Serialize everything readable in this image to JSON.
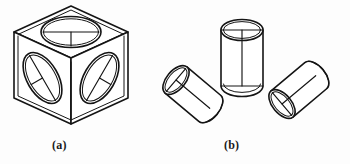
{
  "figure": {
    "background_color": "#fdfdfd",
    "ink_color": "#141414",
    "captions": [
      {
        "key": "a",
        "label": "(a)",
        "subject": "cube-with-isometric-circles"
      },
      {
        "key": "b",
        "label": "(b)",
        "subject": "cylinders-in-three-orientations"
      }
    ]
  },
  "part_a": {
    "name": "isometric-cube",
    "faces": [
      {
        "name": "top-face",
        "circle": "ellipse-horizontal-major-axis",
        "has_center_lines": true
      },
      {
        "name": "left-face",
        "circle": "ellipse-tilted-left",
        "has_center_lines": true
      },
      {
        "name": "right-face",
        "circle": "ellipse-tilted-right",
        "has_center_lines": true
      }
    ]
  },
  "part_b": {
    "name": "cylinder-group",
    "cylinders": [
      {
        "name": "cylinder-tilted-left",
        "orientation": "axis upper-left to lower-right"
      },
      {
        "name": "cylinder-vertical",
        "orientation": "axis vertical"
      },
      {
        "name": "cylinder-tilted-right",
        "orientation": "axis lower-left to upper-right"
      }
    ]
  }
}
